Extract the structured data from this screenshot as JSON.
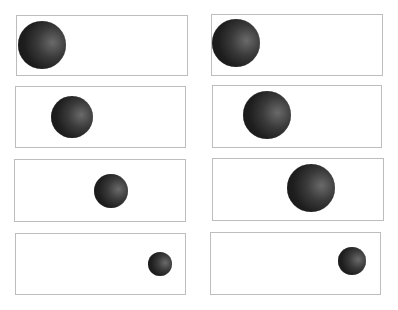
{
  "figure": {
    "panel_border_color": "#bdbdbd",
    "ball_color": "#1e1e1e",
    "columns": [
      {
        "name": "left",
        "panels": [
          {
            "x": 16,
            "y": 15,
            "w": 172,
            "h": 61,
            "ball": {
              "cx": 42,
              "cy": 45,
              "r": 24
            }
          },
          {
            "x": 15,
            "y": 86,
            "w": 171,
            "h": 62,
            "ball": {
              "cx": 72,
              "cy": 117,
              "r": 21
            }
          },
          {
            "x": 14,
            "y": 159,
            "w": 172,
            "h": 63,
            "ball": {
              "cx": 111,
              "cy": 191,
              "r": 17
            }
          },
          {
            "x": 15,
            "y": 233,
            "w": 171,
            "h": 62,
            "ball": {
              "cx": 160,
              "cy": 264,
              "r": 12
            }
          }
        ]
      },
      {
        "name": "right",
        "panels": [
          {
            "x": 211,
            "y": 14,
            "w": 172,
            "h": 62,
            "ball": {
              "cx": 236,
              "cy": 43,
              "r": 24
            }
          },
          {
            "x": 212,
            "y": 85,
            "w": 170,
            "h": 63,
            "ball": {
              "cx": 267,
              "cy": 115,
              "r": 24
            }
          },
          {
            "x": 212,
            "y": 158,
            "w": 172,
            "h": 63,
            "ball": {
              "cx": 311,
              "cy": 188,
              "r": 24
            }
          },
          {
            "x": 210,
            "y": 232,
            "w": 171,
            "h": 63,
            "ball": {
              "cx": 352,
              "cy": 261,
              "r": 14
            }
          }
        ]
      }
    ]
  }
}
